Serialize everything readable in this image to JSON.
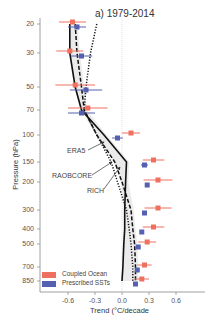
{
  "chart_data": {
    "type": "line",
    "title": "a) 1979-2014",
    "xlabel": "Trend (°C/decade",
    "ylabel": "Pressure (hPa)",
    "xlim": [
      -0.9,
      0.9
    ],
    "ylim": [
      850,
      20
    ],
    "yscale": "log",
    "grid": false,
    "x_ticks": [
      "-0.6",
      "-0.3",
      "0.0",
      "0.3",
      "0.6"
    ],
    "y_ticks": [
      "20",
      "30",
      "50",
      "70",
      "100",
      "150",
      "200",
      "300",
      "400",
      "500",
      "700",
      "850"
    ],
    "pressure_levels": [
      20,
      30,
      50,
      70,
      100,
      150,
      200,
      300,
      400,
      500,
      700,
      850
    ],
    "series": [
      {
        "name": "ERA5",
        "style": "solid",
        "color": "#111111",
        "values": [
          -0.58,
          -0.58,
          -0.52,
          -0.45,
          -0.2,
          0.05,
          0.04,
          0.03,
          0.03,
          0.02,
          0.01,
          0.0
        ]
      },
      {
        "name": "RAOBCORE",
        "style": "dashed",
        "color": "#111111",
        "values": [
          -0.52,
          -0.5,
          -0.45,
          -0.42,
          -0.28,
          -0.08,
          0.0,
          0.1,
          0.12,
          0.14,
          0.15,
          0.15
        ]
      },
      {
        "name": "RICH",
        "style": "dotted",
        "color": "#111111",
        "values": [
          -0.28,
          -0.35,
          -0.4,
          -0.42,
          -0.28,
          -0.12,
          -0.05,
          0.05,
          0.08,
          0.1,
          0.12,
          0.12
        ]
      },
      {
        "name": "Coupled Ocean",
        "style": "marker-errorbar",
        "color": "#f07060",
        "values": [
          -0.55,
          -0.58,
          -0.52,
          -0.38,
          0.1,
          0.35,
          0.4,
          0.4,
          0.35,
          0.28,
          0.25,
          0.22
        ],
        "errors": [
          0.15,
          0.15,
          0.22,
          0.22,
          0.1,
          0.12,
          0.16,
          0.15,
          0.12,
          0.1,
          0.08,
          0.08
        ]
      },
      {
        "name": "Prescribed SSTs",
        "style": "marker-errorbar",
        "color": "#5560b0",
        "values": [
          -0.5,
          -0.45,
          -0.4,
          -0.45,
          -0.05,
          0.25,
          0.28,
          0.25,
          0.22,
          0.18,
          0.17,
          0.15
        ],
        "errors": [
          0.1,
          0.12,
          0.18,
          0.15,
          0.06,
          0.04,
          0.02,
          0.02,
          0.02,
          0.02,
          0.02,
          0.02
        ]
      }
    ],
    "shaded_band": {
      "name": "reanalysis spread",
      "color": "#dddddd"
    },
    "annotations": [
      "ERA5",
      "RAOBCORE",
      "RICH"
    ],
    "legend": {
      "position": "lower-left",
      "entries": [
        "Coupled Ocean",
        "Prescribed SSTs"
      ]
    }
  },
  "labels": {
    "title": "a) 1979-2014",
    "xlabel": "Trend (°C/decade",
    "ylabel": "Pressure (hPa)",
    "ann_era5": "ERA5",
    "ann_raobcore": "RAOBCORE",
    "ann_rich": "RICH",
    "legend_coupled": "Coupled Ocean",
    "legend_prescribed": "Prescribed SSTs",
    "caption": "Figure 4. The vertical temperature trends..."
  },
  "colors": {
    "coupled": "#f07060",
    "prescribed": "#5560b0",
    "line": "#111111",
    "band": "#dddddd",
    "axis": "#888888"
  }
}
